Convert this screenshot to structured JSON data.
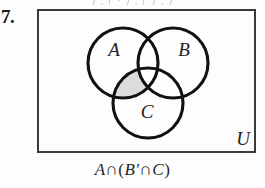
{
  "problem": {
    "number": "7.",
    "top_bleed_text": ")  ,  (    ·  ) ,  (        ) ,  )"
  },
  "figure": {
    "universe_label": "U",
    "rect": {
      "x": 38,
      "y": 10,
      "width": 217,
      "height": 142
    },
    "circles": [
      {
        "label": "A",
        "cx": 123,
        "cy": 63,
        "r": 35,
        "label_x": 114,
        "label_y": 56
      },
      {
        "label": "B",
        "cx": 173,
        "cy": 63,
        "r": 35,
        "label_x": 170,
        "label_y": 56
      },
      {
        "label": "C",
        "cx": 148,
        "cy": 103,
        "r": 35,
        "label_x": 145,
        "label_y": 114
      }
    ],
    "shaded_region": "A-intersect-C-minus-B",
    "shade_color": "#dcdcdc",
    "stroke_color": "#111111",
    "rect_stroke_color": "#3a3a3a"
  },
  "caption": {
    "full": "A ∩ (B′ ∩ C)",
    "parts": {
      "a": "A",
      "cap1": "∩",
      "open": "(",
      "b_prime": "B′",
      "cap2": "∩",
      "c": "C",
      "close": ")"
    }
  }
}
